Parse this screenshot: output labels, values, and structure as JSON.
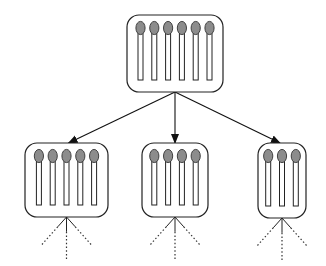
{
  "diagram": {
    "colors": {
      "stroke": "#222222",
      "match_head": "#8c8c8c",
      "background": "#ffffff"
    },
    "root": {
      "label": "root",
      "matches": 6,
      "box": {
        "x": 127,
        "y": 15,
        "w": 96,
        "h": 77
      }
    },
    "children": [
      {
        "label": "child-1",
        "matches": 5,
        "box": {
          "x": 25,
          "y": 143,
          "w": 83,
          "h": 74
        }
      },
      {
        "label": "child-2",
        "matches": 4,
        "box": {
          "x": 142,
          "y": 143,
          "w": 66,
          "h": 74
        }
      },
      {
        "label": "child-3",
        "matches": 3,
        "box": {
          "x": 258,
          "y": 143,
          "w": 48,
          "h": 75
        }
      }
    ],
    "edges": [
      {
        "from": "root",
        "to": "child-1",
        "style": "solid-arrow"
      },
      {
        "from": "root",
        "to": "child-2",
        "style": "solid-arrow"
      },
      {
        "from": "root",
        "to": "child-3",
        "style": "solid-arrow"
      }
    ],
    "continuation": "dotted branches below each child (3 per child)"
  }
}
